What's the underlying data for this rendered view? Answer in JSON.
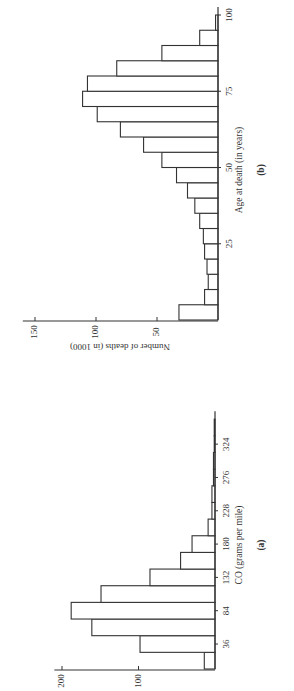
{
  "chart_data": [
    {
      "id": "a",
      "type": "bar",
      "panel_label": "(a)",
      "title": "",
      "xlabel": "CO (grams per mile)",
      "ylabel": "",
      "x_tick_labels": [
        "36",
        "84",
        "132",
        "180",
        "228",
        "276",
        "324"
      ],
      "x_ticks": [
        36,
        84,
        132,
        180,
        228,
        276,
        324
      ],
      "y_tick_labels": [
        "100",
        "200"
      ],
      "y_ticks": [
        100,
        200
      ],
      "bin_width": 24,
      "categories": [
        "0-24",
        "24-48",
        "48-72",
        "72-96",
        "96-120",
        "120-144",
        "144-168",
        "168-192",
        "192-216",
        "216-240",
        "240-264",
        "264-288",
        "288-312",
        "312-336",
        "336-360"
      ],
      "values": [
        14,
        98,
        161,
        188,
        149,
        85,
        45,
        30,
        9,
        4,
        4,
        2,
        2,
        1,
        1
      ],
      "xlim": [
        0,
        360
      ],
      "ylim": [
        0,
        210
      ],
      "grid": false,
      "legend": null,
      "orientation_note": "rendered rotated 90 degrees"
    },
    {
      "id": "b",
      "type": "bar",
      "panel_label": "(b)",
      "title": "",
      "xlabel": "Age at death (in years)",
      "ylabel": "Number of deaths (in 1000)",
      "x_tick_labels": [
        "25",
        "50",
        "75",
        "100"
      ],
      "x_ticks": [
        25,
        50,
        75,
        100
      ],
      "y_tick_labels": [
        "50",
        "100",
        "150"
      ],
      "y_ticks": [
        50,
        100,
        150
      ],
      "bin_width": 5,
      "categories": [
        "0-5",
        "5-10",
        "10-15",
        "15-20",
        "20-25",
        "25-30",
        "30-35",
        "35-40",
        "40-45",
        "45-50",
        "50-55",
        "55-60",
        "60-65",
        "65-70",
        "70-75",
        "75-80",
        "80-85",
        "85-90",
        "90-95",
        "95-100"
      ],
      "values": [
        32,
        11,
        8,
        9,
        11,
        12,
        15,
        19,
        25,
        34,
        46,
        61,
        80,
        99,
        111,
        107,
        83,
        46,
        15,
        2
      ],
      "xlim": [
        0,
        100
      ],
      "ylim": [
        0,
        160
      ],
      "grid": false,
      "legend": null,
      "orientation_note": "rendered rotated 90 degrees"
    }
  ]
}
